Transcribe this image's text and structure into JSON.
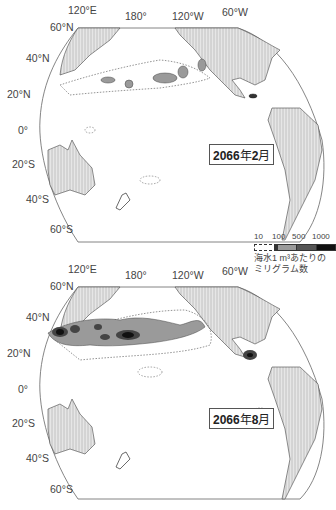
{
  "maps": [
    {
      "id": "feb",
      "title_year": "2066",
      "title_kanji_year": "年",
      "title_month": "2",
      "title_kanji_month": "月",
      "lon_labels": [
        "120°E",
        "180°",
        "120°W",
        "60°W"
      ],
      "lat_labels": [
        "60°N",
        "40°N",
        "20°N",
        "0°",
        "20°S",
        "40°S",
        "60°S"
      ]
    },
    {
      "id": "aug",
      "title_year": "2066",
      "title_kanji_year": "年",
      "title_month": "8",
      "title_kanji_month": "月",
      "lon_labels": [
        "120°E",
        "180°",
        "120°W",
        "60°W"
      ],
      "lat_labels": [
        "60°N",
        "40°N",
        "20°N",
        "0°",
        "20°S",
        "40°S",
        "60°S"
      ]
    }
  ],
  "legend": {
    "ticks": [
      "10",
      "100",
      "500",
      "1000"
    ],
    "colors": [
      "#ffffff",
      "#9a9a9a",
      "#555555",
      "#111111"
    ],
    "caption_line1": "海水1 m³あたりの",
    "caption_line2": "ミリグラム数"
  },
  "colors": {
    "land": "#d8d8d8",
    "outline": "#555555",
    "level_100": "#9a9a9a",
    "level_500": "#555555",
    "level_1000": "#111111"
  }
}
